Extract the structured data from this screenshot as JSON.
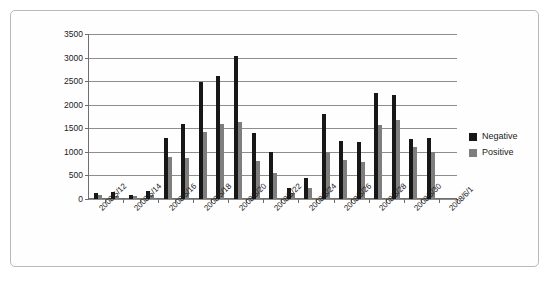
{
  "chart_data": {
    "type": "bar",
    "title": "",
    "subtitle": "",
    "xlabel": "",
    "ylabel": "",
    "ylim": [
      0,
      3500
    ],
    "ytick_step": 500,
    "yticks": [
      0,
      500,
      1000,
      1500,
      2000,
      2500,
      3000,
      3500
    ],
    "ytick_labels": [
      "0",
      "500",
      "1000",
      "1500",
      "2000",
      "2500",
      "3000",
      "3500"
    ],
    "grid": true,
    "legend_position": "right",
    "colors": {
      "negative": "#171717",
      "positive": "#7e7e7e",
      "gridline": "#8d8d8d",
      "axis": "#6e6e6e",
      "border": "#b9b9b9",
      "background": "#ffffff",
      "text": "#1b1b1b"
    },
    "categories": [
      "2008/5/12",
      "2008/5/13",
      "2008/5/14",
      "2008/5/15",
      "2008/5/16",
      "2008/5/17",
      "2008/5/18",
      "2008/5/19",
      "2008/5/20",
      "2008/5/21",
      "2008/5/22",
      "2008/5/23",
      "2008/5/24",
      "2008/5/25",
      "2008/5/26",
      "2008/5/27",
      "2008/5/28",
      "2008/5/29",
      "2008/5/30",
      "2008/5/31",
      "2008/6/1"
    ],
    "tick_labels": [
      "2008/5/12",
      "",
      "2008/5/14",
      "",
      "2008/5/16",
      "",
      "2008/5/18",
      "",
      "2008/5/20",
      "",
      "2008/5/22",
      "",
      "2008/5/24",
      "",
      "2008/5/26",
      "",
      "2008/5/28",
      "",
      "2008/5/30",
      "",
      "2008/6/1"
    ],
    "series": [
      {
        "name": "Negative",
        "color": "#171717",
        "values": [
          130,
          145,
          75,
          160,
          1290,
          1590,
          2490,
          2600,
          3040,
          1410,
          995,
          230,
          445,
          1805,
          1230,
          1215,
          2255,
          2210,
          1275,
          1300,
          0
        ]
      },
      {
        "name": "Positive",
        "color": "#7e7e7e",
        "values": [
          80,
          70,
          60,
          90,
          900,
          860,
          1420,
          1595,
          1635,
          815,
          560,
          130,
          240,
          1005,
          835,
          780,
          1570,
          1670,
          1095,
          995,
          0
        ]
      }
    ]
  },
  "legend": {
    "items": [
      {
        "label": "Negative",
        "swatch": "negative"
      },
      {
        "label": "Positive",
        "swatch": "positive"
      }
    ]
  }
}
